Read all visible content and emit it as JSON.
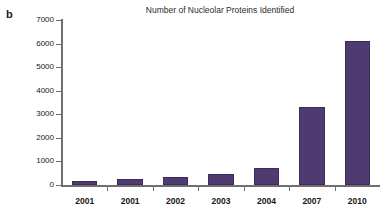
{
  "panel": {
    "label": "b"
  },
  "chart_data": {
    "type": "bar",
    "title": "Number of Nucleolar Proteins Identified",
    "xlabel": "",
    "ylabel": "",
    "categories": [
      "2001",
      "2001",
      "2002",
      "2003",
      "2004",
      "2007",
      "2010"
    ],
    "values": [
      180,
      260,
      330,
      450,
      740,
      3300,
      6100
    ],
    "series": [
      {
        "name": "Number of Nucleolar Proteins Identified",
        "values": [
          180,
          260,
          330,
          450,
          740,
          3300,
          6100
        ]
      }
    ],
    "ylim": [
      0,
      7000
    ],
    "ytick_labels": [
      "0",
      "1000",
      "2000",
      "3000",
      "4000",
      "5000",
      "6000",
      "7000"
    ],
    "ytick_values": [
      0,
      1000,
      2000,
      3000,
      4000,
      5000,
      6000,
      7000
    ],
    "grid": false,
    "legend": false,
    "bar_color": "#4f3b72",
    "axis_color": "#6f6f6f"
  }
}
